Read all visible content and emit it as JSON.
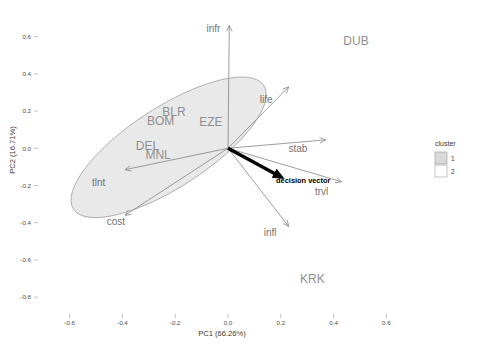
{
  "chart_data": {
    "type": "scatter",
    "subtype": "pca-biplot",
    "title": "",
    "xlabel": "PC1 (66.26%)",
    "ylabel": "PC2 (16.71%)",
    "xlim": [
      -0.72,
      0.72
    ],
    "ylim": [
      -0.88,
      0.7
    ],
    "xticks": [
      "-0.6",
      "-0.4",
      "-0.2",
      "0.0",
      "0.2",
      "0.4",
      "0.6"
    ],
    "xtick_values": [
      -0.6,
      -0.4,
      -0.2,
      0.0,
      0.2,
      0.4,
      0.6
    ],
    "yticks": [
      "0.6",
      "0.4",
      "0.2",
      "0.0",
      "-0.2",
      "-0.4",
      "-0.6",
      "-0.8"
    ],
    "ytick_values": [
      0.6,
      0.4,
      0.2,
      0.0,
      -0.2,
      -0.4,
      -0.6,
      -0.8
    ],
    "grid": false,
    "legend_position": "right",
    "variance_explained": {
      "pc1_percent": 66.26,
      "pc2_percent": 16.71
    },
    "points": [
      {
        "label": "BLR",
        "x": -0.205,
        "y": 0.175,
        "cluster": 1
      },
      {
        "label": "BOM",
        "x": -0.255,
        "y": 0.125,
        "cluster": 1
      },
      {
        "label": "EZE",
        "x": -0.065,
        "y": 0.12,
        "cluster": 1
      },
      {
        "label": "DEL",
        "x": -0.305,
        "y": -0.01,
        "cluster": 1
      },
      {
        "label": "MNL",
        "x": -0.265,
        "y": -0.06,
        "cluster": 1
      },
      {
        "label": "DUB",
        "x": 0.485,
        "y": 0.555,
        "cluster": 2
      },
      {
        "label": "KRK",
        "x": 0.32,
        "y": -0.725,
        "cluster": 2
      }
    ],
    "loading_vectors": [
      {
        "label": "infr",
        "dx": 0.005,
        "dy": 0.66,
        "label_x": -0.055,
        "label_y": 0.625
      },
      {
        "label": "life",
        "dx": 0.23,
        "dy": 0.33,
        "label_x": 0.145,
        "label_y": 0.245
      },
      {
        "label": "stab",
        "dx": 0.37,
        "dy": 0.045,
        "label_x": 0.265,
        "label_y": -0.02
      },
      {
        "label": "trvl",
        "dx": 0.43,
        "dy": -0.18,
        "label_x": 0.355,
        "label_y": -0.25
      },
      {
        "label": "infl",
        "dx": 0.23,
        "dy": -0.42,
        "label_x": 0.16,
        "label_y": -0.47
      },
      {
        "label": "cost",
        "dx": -0.39,
        "dy": -0.36,
        "label_x": -0.425,
        "label_y": -0.41
      },
      {
        "label": "tlnt",
        "dx": -0.39,
        "dy": -0.115,
        "label_x": -0.49,
        "label_y": -0.205
      }
    ],
    "decision_vector": {
      "label": "decision vector",
      "dx": 0.215,
      "dy": -0.165,
      "label_x": 0.285,
      "label_y": -0.185,
      "color": "#000000"
    },
    "cluster_ellipse": {
      "cluster": 1,
      "center_x": -0.225,
      "center_y": 0.005,
      "semi_major": 0.43,
      "semi_minor": 0.215,
      "rotation_deg": -33,
      "fill": "#e9e9e9",
      "stroke": "#9b9b9b"
    },
    "legend": {
      "title": "cluster",
      "entries": [
        {
          "label": "1",
          "fill": "#d9d9d9"
        },
        {
          "label": "2",
          "fill": "#ffffff"
        }
      ]
    },
    "colors": {
      "background": "#ffffff",
      "axis_text": "#4d4d4d",
      "point_label": "#8f8f8f",
      "vector": "#8a8a8a",
      "decision": "#000000"
    }
  }
}
